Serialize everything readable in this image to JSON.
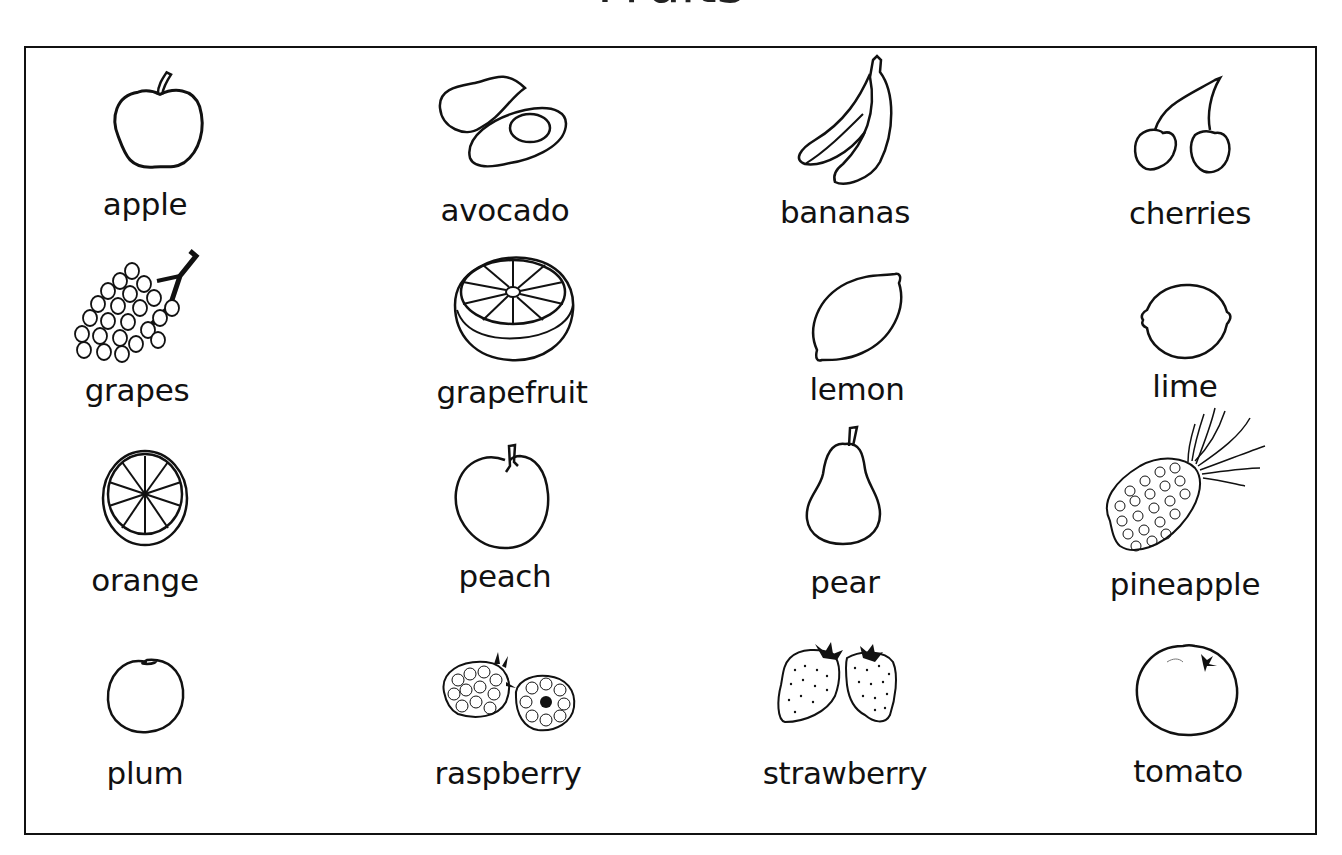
{
  "title": "Fruits",
  "fruits": [
    {
      "name": "apple"
    },
    {
      "name": "avocado"
    },
    {
      "name": "bananas"
    },
    {
      "name": "cherries"
    },
    {
      "name": "grapes"
    },
    {
      "name": "grapefruit"
    },
    {
      "name": "lemon"
    },
    {
      "name": "lime"
    },
    {
      "name": "orange"
    },
    {
      "name": "peach"
    },
    {
      "name": "pear"
    },
    {
      "name": "pineapple"
    },
    {
      "name": "plum"
    },
    {
      "name": "raspberry"
    },
    {
      "name": "strawberry"
    },
    {
      "name": "tomato"
    }
  ],
  "colors": {
    "ink": "#111111",
    "background": "#ffffff"
  }
}
